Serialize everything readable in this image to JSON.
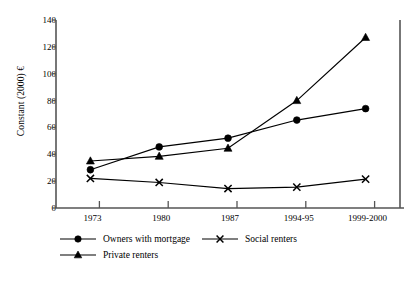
{
  "chart_data": {
    "type": "line",
    "title": "",
    "subtitle": "",
    "xlabel": "",
    "ylabel": "Constant (2000) €",
    "categories": [
      "1973",
      "1980",
      "1987",
      "1994-95",
      "1999-2000"
    ],
    "x": [
      "1973",
      "1980",
      "1987",
      "1994-95",
      "1999-2000"
    ],
    "ylim": [
      0,
      140
    ],
    "yticks": [
      0,
      20,
      40,
      60,
      80,
      100,
      120,
      140
    ],
    "ytick_labels": [
      "0",
      "20",
      "40",
      "60",
      "80",
      "100",
      "120",
      "140"
    ],
    "grid": false,
    "legend_position": "below-plot",
    "series": [
      {
        "name": "Owners with mortgage",
        "marker": "circle",
        "color": "#000000",
        "values": [
          28.5,
          45.5,
          52.0,
          65.5,
          74.0
        ]
      },
      {
        "name": "Social renters",
        "marker": "x",
        "color": "#000000",
        "values": [
          22.0,
          19.0,
          14.5,
          15.5,
          21.5
        ]
      },
      {
        "name": "Private renters",
        "marker": "triangle",
        "color": "#000000",
        "values": [
          35.0,
          38.5,
          44.5,
          80.0,
          127.0
        ]
      }
    ],
    "annotations": []
  },
  "legend": {
    "items": [
      {
        "label": "Owners with mortgage",
        "marker": "circle"
      },
      {
        "label": "Social renters",
        "marker": "x"
      },
      {
        "label": "Private renters",
        "marker": "triangle"
      }
    ]
  },
  "colors": {
    "axis": "#555555",
    "line": "#000000",
    "marker": "#000000",
    "background": "#ffffff",
    "text": "#000000"
  }
}
